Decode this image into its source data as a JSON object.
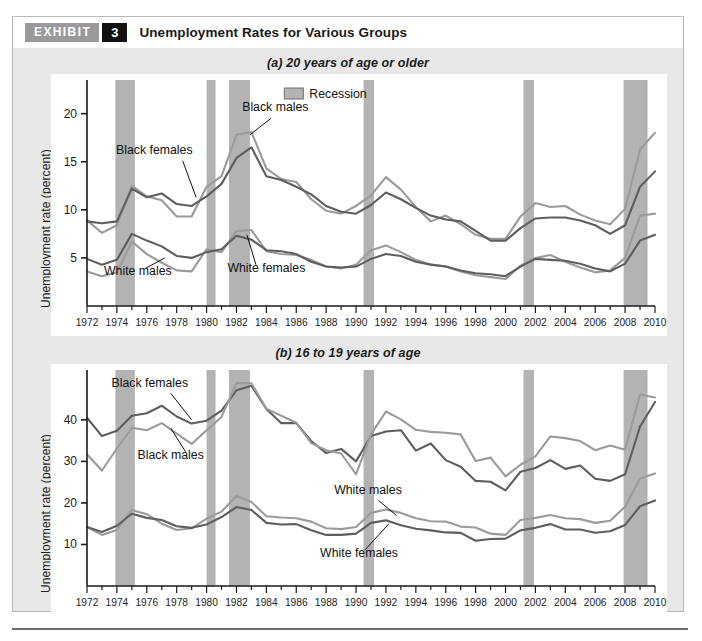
{
  "header": {
    "tag": "EXHIBIT",
    "number": "3",
    "title": "Unemployment Rates for Various Groups"
  },
  "legend": {
    "recession_label": "Recession",
    "recession_color": "#b3b3b3"
  },
  "colors": {
    "dark_line": "#5e5e5e",
    "light_line": "#9b9b9b",
    "recession_band": "#b3b3b3",
    "panel_bg": "#e8e8e8",
    "plot_bg": "#ffffff",
    "axis": "#1b1b1b"
  },
  "chart_data": [
    {
      "type": "line",
      "title": "(a) 20 years of age or older",
      "xlabel": "",
      "ylabel": "Unemployment rate (percent)",
      "xlim": [
        1972,
        2010
      ],
      "ylim": [
        0,
        23.5
      ],
      "yticks": [
        5,
        10,
        15,
        20
      ],
      "grid": false,
      "legend": "inside-top-right",
      "x": [
        1972,
        1973,
        1974,
        1975,
        1976,
        1977,
        1978,
        1979,
        1980,
        1981,
        1982,
        1983,
        1984,
        1985,
        1986,
        1987,
        1988,
        1989,
        1990,
        1991,
        1992,
        1993,
        1994,
        1995,
        1996,
        1997,
        1998,
        1999,
        2000,
        2001,
        2002,
        2003,
        2004,
        2005,
        2006,
        2007,
        2008,
        2009,
        2010
      ],
      "recessions": [
        [
          1973.9,
          1975.2
        ],
        [
          1980.0,
          1980.6
        ],
        [
          1981.5,
          1982.9
        ],
        [
          1990.5,
          1991.2
        ],
        [
          2001.2,
          2001.9
        ],
        [
          2007.9,
          2009.5
        ]
      ],
      "series": [
        {
          "name": "Black males",
          "color": "#9b9b9b",
          "values": [
            8.9,
            7.6,
            8.4,
            12.5,
            11.4,
            11.0,
            9.3,
            9.3,
            12.4,
            13.5,
            17.8,
            18.1,
            14.3,
            13.2,
            12.9,
            11.1,
            9.9,
            9.6,
            10.4,
            11.5,
            13.4,
            12.1,
            10.3,
            8.8,
            9.4,
            8.5,
            7.4,
            7.0,
            7.0,
            9.3,
            10.7,
            10.3,
            10.4,
            9.5,
            8.9,
            8.5,
            10.1,
            16.3,
            18.0
          ]
        },
        {
          "name": "Black females",
          "color": "#5e5e5e",
          "values": [
            8.8,
            8.6,
            8.8,
            12.2,
            11.3,
            11.7,
            10.6,
            10.4,
            11.4,
            12.7,
            15.4,
            16.5,
            13.5,
            13.1,
            12.4,
            11.6,
            10.4,
            9.8,
            9.6,
            10.5,
            11.8,
            11.1,
            10.2,
            9.4,
            9.0,
            8.8,
            7.8,
            6.8,
            6.8,
            8.1,
            9.1,
            9.2,
            9.2,
            8.9,
            8.4,
            7.5,
            8.4,
            12.4,
            14.0
          ]
        },
        {
          "name": "White males",
          "color": "#9b9b9b",
          "values": [
            3.6,
            3.1,
            3.5,
            6.7,
            5.4,
            4.5,
            3.7,
            3.6,
            5.9,
            5.6,
            7.8,
            7.9,
            5.7,
            5.4,
            5.3,
            4.8,
            4.1,
            3.9,
            4.3,
            5.8,
            6.3,
            5.6,
            4.8,
            4.3,
            4.1,
            3.6,
            3.2,
            3.0,
            2.8,
            4.2,
            5.0,
            5.3,
            4.6,
            4.0,
            3.5,
            3.7,
            5.0,
            9.4,
            9.6
          ]
        },
        {
          "name": "White females",
          "color": "#5e5e5e",
          "values": [
            4.9,
            4.3,
            4.8,
            7.5,
            6.8,
            6.2,
            5.2,
            5.0,
            5.6,
            5.9,
            7.3,
            6.9,
            5.8,
            5.7,
            5.4,
            4.6,
            4.1,
            4.0,
            4.1,
            4.9,
            5.4,
            5.2,
            4.6,
            4.3,
            4.1,
            3.7,
            3.4,
            3.3,
            3.1,
            4.1,
            4.9,
            4.8,
            4.7,
            4.4,
            3.9,
            3.6,
            4.4,
            6.8,
            7.4
          ]
        }
      ],
      "annotations": [
        {
          "text": "Black males",
          "x": 1984.6,
          "y": 20.3
        },
        {
          "text": "Black females",
          "x": 1976.5,
          "y": 15.8
        },
        {
          "text": "White males",
          "x": 1975.4,
          "y": 3.2
        },
        {
          "text": "White females",
          "x": 1984.0,
          "y": 3.5
        }
      ]
    },
    {
      "type": "line",
      "title": "(b) 16 to 19 years of age",
      "xlabel": "",
      "ylabel": "Unemployment rate (percent)",
      "xlim": [
        1972,
        2010
      ],
      "ylim": [
        0,
        52
      ],
      "yticks": [
        10,
        20,
        30,
        40
      ],
      "grid": false,
      "legend": "none",
      "x": [
        1972,
        1973,
        1974,
        1975,
        1976,
        1977,
        1978,
        1979,
        1980,
        1981,
        1982,
        1983,
        1984,
        1985,
        1986,
        1987,
        1988,
        1989,
        1990,
        1991,
        1992,
        1993,
        1994,
        1995,
        1996,
        1997,
        1998,
        1999,
        2000,
        2001,
        2002,
        2003,
        2004,
        2005,
        2006,
        2007,
        2008,
        2009,
        2010
      ],
      "recessions": [
        [
          1973.9,
          1975.2
        ],
        [
          1980.0,
          1980.6
        ],
        [
          1981.5,
          1982.9
        ],
        [
          1990.5,
          1991.2
        ],
        [
          2001.2,
          2001.9
        ],
        [
          2007.9,
          2009.5
        ]
      ],
      "series": [
        {
          "name": "Black females",
          "color": "#5e5e5e",
          "values": [
            40.5,
            36.1,
            37.4,
            41.0,
            41.6,
            43.4,
            40.8,
            39.1,
            39.8,
            42.2,
            47.1,
            48.2,
            42.6,
            39.2,
            39.2,
            34.9,
            32.0,
            33.0,
            30.0,
            36.1,
            37.2,
            37.5,
            32.6,
            34.3,
            30.3,
            28.7,
            25.3,
            25.1,
            23.0,
            27.5,
            28.4,
            30.3,
            28.2,
            29.0,
            25.8,
            25.3,
            26.9,
            38.4,
            44.3
          ]
        },
        {
          "name": "Black males",
          "color": "#9b9b9b",
          "values": [
            31.7,
            27.8,
            33.1,
            38.1,
            37.5,
            39.2,
            36.7,
            34.2,
            37.5,
            40.7,
            48.9,
            48.8,
            42.7,
            41.0,
            39.3,
            34.4,
            32.7,
            31.9,
            26.9,
            36.5,
            42.0,
            40.1,
            37.6,
            37.1,
            36.9,
            36.5,
            30.1,
            30.9,
            26.4,
            29.2,
            31.2,
            36.0,
            35.6,
            34.9,
            32.7,
            33.8,
            32.8,
            46.1,
            45.4
          ]
        },
        {
          "name": "White males",
          "color": "#9b9b9b",
          "values": [
            14.2,
            12.3,
            13.5,
            18.3,
            17.3,
            15.0,
            13.5,
            13.9,
            16.2,
            17.9,
            21.7,
            20.2,
            16.8,
            16.5,
            16.3,
            15.5,
            13.9,
            13.7,
            14.2,
            17.6,
            18.4,
            17.6,
            16.3,
            15.6,
            15.5,
            14.3,
            14.1,
            12.6,
            12.3,
            15.9,
            16.4,
            17.1,
            16.3,
            16.1,
            15.2,
            15.7,
            19.1,
            25.9,
            27.1
          ]
        },
        {
          "name": "White females",
          "color": "#5e5e5e",
          "values": [
            14.2,
            13.0,
            14.5,
            17.4,
            16.4,
            15.9,
            14.4,
            14.0,
            14.8,
            16.6,
            19.0,
            18.3,
            15.2,
            14.8,
            14.9,
            13.4,
            12.3,
            12.3,
            12.6,
            15.2,
            15.8,
            14.6,
            13.8,
            13.4,
            12.9,
            12.8,
            10.9,
            11.3,
            11.4,
            13.4,
            14.0,
            14.9,
            13.6,
            13.6,
            12.8,
            13.2,
            14.7,
            19.2,
            20.6
          ]
        }
      ],
      "annotations": [
        {
          "text": "Black females",
          "x": 1976.2,
          "y": 48.0
        },
        {
          "text": "Black males",
          "x": 1977.6,
          "y": 30.5
        },
        {
          "text": "White males",
          "x": 1990.8,
          "y": 22.2
        },
        {
          "text": "White females",
          "x": 1990.2,
          "y": 7.0
        }
      ]
    }
  ]
}
